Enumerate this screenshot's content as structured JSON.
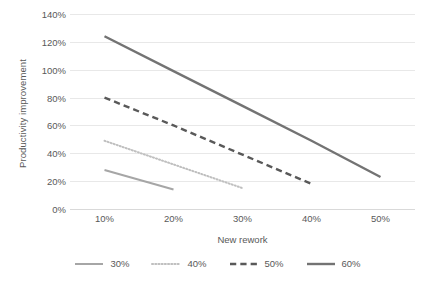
{
  "chart_data": {
    "type": "line",
    "title": "",
    "xlabel": "New rework",
    "ylabel": "Productivity improvement",
    "categories": [
      "10%",
      "20%",
      "30%",
      "40%",
      "50%"
    ],
    "x": [
      10,
      20,
      30,
      40,
      50
    ],
    "ylim": [
      0,
      140
    ],
    "xlim": [
      5,
      55
    ],
    "yticks": [
      "0%",
      "20%",
      "40%",
      "60%",
      "80%",
      "100%",
      "120%",
      "140%"
    ],
    "ytick_values": [
      0,
      20,
      40,
      60,
      80,
      100,
      120,
      140
    ],
    "grid": "horizontal",
    "legend_position": "bottom",
    "series": [
      {
        "name": "30%",
        "x": [
          10,
          20
        ],
        "values": [
          28,
          14
        ],
        "style": "solid",
        "color": "#a6a6a6",
        "width": 2
      },
      {
        "name": "40%",
        "x": [
          10,
          20,
          30
        ],
        "values": [
          49,
          32,
          15
        ],
        "style": "dotted",
        "color": "#bfbfbf",
        "width": 2
      },
      {
        "name": "50%",
        "x": [
          10,
          20,
          30,
          40
        ],
        "values": [
          80,
          60,
          39,
          18
        ],
        "style": "dashed",
        "color": "#595959",
        "width": 2.4
      },
      {
        "name": "60%",
        "x": [
          10,
          20,
          30,
          40,
          50
        ],
        "values": [
          124,
          99,
          74,
          49,
          23
        ],
        "style": "solid",
        "color": "#737373",
        "width": 2.4
      }
    ]
  },
  "legend": {
    "items": [
      {
        "label": "30%"
      },
      {
        "label": "40%"
      },
      {
        "label": "50%"
      },
      {
        "label": "60%"
      }
    ]
  },
  "colors": {
    "gridline": "#e8e8e8",
    "baseline": "#d9d9d9",
    "text": "#595959",
    "background": "#ffffff"
  }
}
